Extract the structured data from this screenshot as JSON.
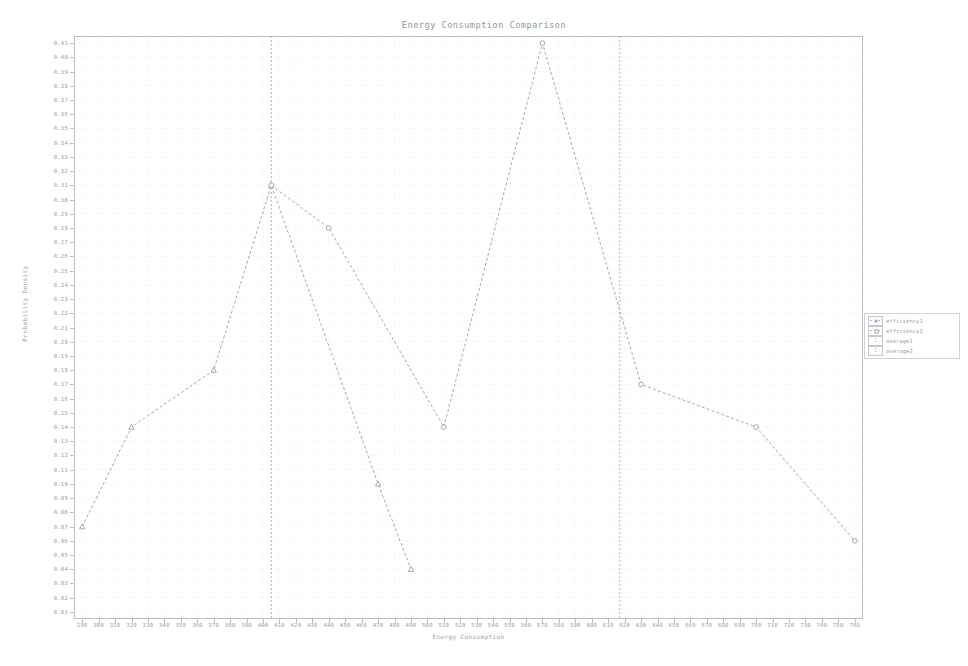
{
  "chart_data": {
    "type": "line",
    "title": "Energy Consumption Comparison",
    "xlabel": "Energy Consumption",
    "ylabel": "Probability Density",
    "xlim": [
      285,
      765
    ],
    "ylim": [
      0.005,
      0.415
    ],
    "grid": true,
    "legend_position": "right",
    "xticks": [
      290,
      300,
      310,
      320,
      330,
      340,
      350,
      360,
      370,
      380,
      390,
      400,
      410,
      420,
      430,
      440,
      450,
      460,
      470,
      480,
      490,
      500,
      510,
      520,
      530,
      540,
      550,
      560,
      570,
      580,
      590,
      600,
      610,
      620,
      630,
      640,
      650,
      660,
      670,
      680,
      690,
      700,
      710,
      720,
      730,
      740,
      750,
      760
    ],
    "yticks": [
      0.41,
      0.4,
      0.39,
      0.38,
      0.37,
      0.36,
      0.35,
      0.34,
      0.33,
      0.32,
      0.31,
      0.3,
      0.29,
      0.28,
      0.27,
      0.26,
      0.25,
      0.24,
      0.23,
      0.22,
      0.21,
      0.2,
      0.19,
      0.18,
      0.17,
      0.16,
      0.15,
      0.14,
      0.13,
      0.12,
      0.11,
      0.1,
      0.09,
      0.08,
      0.07,
      0.06,
      0.05,
      0.04,
      0.03,
      0.02,
      0.01
    ],
    "series": [
      {
        "name": "efficiency1",
        "marker": "triangle",
        "linestyle": "dashed",
        "color": "#9aa0a6",
        "points": [
          [
            290,
            0.07
          ],
          [
            320,
            0.14
          ],
          [
            370,
            0.18
          ],
          [
            405,
            0.31
          ],
          [
            470,
            0.1
          ],
          [
            490,
            0.04
          ]
        ]
      },
      {
        "name": "efficiency2",
        "marker": "circle",
        "linestyle": "dashed",
        "color": "#9aa0a6",
        "points": [
          [
            405,
            0.31
          ],
          [
            440,
            0.28
          ],
          [
            510,
            0.14
          ],
          [
            570,
            0.41
          ],
          [
            630,
            0.17
          ],
          [
            700,
            0.14
          ],
          [
            760,
            0.06
          ]
        ]
      }
    ],
    "vlines": [
      {
        "name": "average1",
        "x": 405,
        "linestyle": "dashed",
        "color": "#a8aeb4"
      },
      {
        "name": "average2",
        "x": 617,
        "linestyle": "dashed",
        "color": "#a8aeb4"
      }
    ],
    "legend_entries": [
      {
        "label": "efficiency1",
        "marker": "triangle"
      },
      {
        "label": "efficiency2",
        "marker": "circle"
      },
      {
        "label": "average1",
        "marker": "vline"
      },
      {
        "label": "average2",
        "marker": "vline"
      }
    ]
  }
}
